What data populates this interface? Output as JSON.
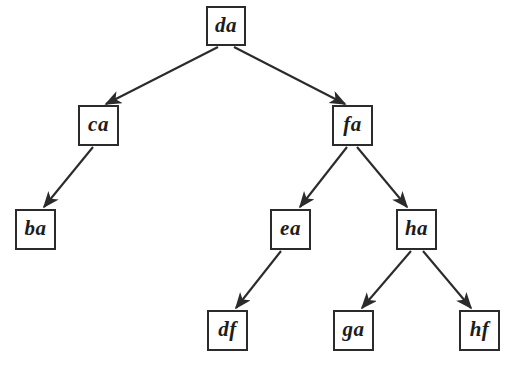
{
  "diagram": {
    "type": "tree",
    "title": "",
    "background_color": "#ffffff",
    "node_border_color": "#2b2b2b",
    "edge_color": "#2b2b2b",
    "label_color": "#1c1c1c",
    "nodes": [
      {
        "id": "da",
        "label": "da",
        "x": 206,
        "y": 6,
        "w": 40,
        "h": 40,
        "level": 0
      },
      {
        "id": "ca",
        "label": "ca",
        "x": 78,
        "y": 105,
        "w": 41,
        "h": 41,
        "level": 1
      },
      {
        "id": "fa",
        "label": "fa",
        "x": 332,
        "y": 105,
        "w": 41,
        "h": 41,
        "level": 1
      },
      {
        "id": "ba",
        "label": "ba",
        "x": 15,
        "y": 209,
        "w": 41,
        "h": 41,
        "level": 2
      },
      {
        "id": "ea",
        "label": "ea",
        "x": 270,
        "y": 209,
        "w": 41,
        "h": 41,
        "level": 2
      },
      {
        "id": "ha",
        "label": "ha",
        "x": 396,
        "y": 209,
        "w": 41,
        "h": 41,
        "level": 2
      },
      {
        "id": "df",
        "label": "df",
        "x": 207,
        "y": 310,
        "w": 41,
        "h": 41,
        "level": 3
      },
      {
        "id": "ga",
        "label": "ga",
        "x": 333,
        "y": 310,
        "w": 41,
        "h": 41,
        "level": 3
      },
      {
        "id": "hf",
        "label": "hf",
        "x": 459,
        "y": 310,
        "w": 41,
        "h": 41,
        "level": 3
      }
    ],
    "edges": [
      {
        "from": "da",
        "to": "ca",
        "x1": 218,
        "y1": 47,
        "x2": 106,
        "y2": 104
      },
      {
        "from": "da",
        "to": "fa",
        "x1": 234,
        "y1": 47,
        "x2": 345,
        "y2": 104
      },
      {
        "from": "ca",
        "to": "ba",
        "x1": 93,
        "y1": 147,
        "x2": 44,
        "y2": 207
      },
      {
        "from": "fa",
        "to": "ea",
        "x1": 347,
        "y1": 147,
        "x2": 300,
        "y2": 207
      },
      {
        "from": "fa",
        "to": "ha",
        "x1": 357,
        "y1": 147,
        "x2": 407,
        "y2": 207
      },
      {
        "from": "ea",
        "to": "df",
        "x1": 281,
        "y1": 251,
        "x2": 236,
        "y2": 308
      },
      {
        "from": "ha",
        "to": "ga",
        "x1": 411,
        "y1": 251,
        "x2": 362,
        "y2": 308
      },
      {
        "from": "ha",
        "to": "hf",
        "x1": 423,
        "y1": 251,
        "x2": 471,
        "y2": 308
      }
    ]
  }
}
